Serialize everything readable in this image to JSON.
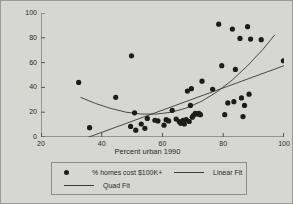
{
  "chart_data": {
    "type": "scatter",
    "title": "",
    "xlabel": "Percent urban 1990",
    "ylabel": "",
    "xlim": [
      20,
      100
    ],
    "ylim": [
      0,
      100
    ],
    "xticks": [
      20,
      40,
      60,
      80,
      100
    ],
    "yticks": [
      0,
      20,
      40,
      60,
      80,
      100
    ],
    "grid": false,
    "legend_position": "below",
    "series": [
      {
        "name": "% homes cost $100K+",
        "marker": "filled-circle",
        "color": "#1c1c1c",
        "points": [
          [
            32.4,
            44.0
          ],
          [
            36.0,
            7.5
          ],
          [
            44.6,
            32.0
          ],
          [
            49.8,
            65.5
          ],
          [
            49.5,
            8.5
          ],
          [
            50.8,
            19.5
          ],
          [
            51.2,
            5.5
          ],
          [
            53.0,
            10.5
          ],
          [
            54.2,
            7.0
          ],
          [
            55.0,
            15.0
          ],
          [
            57.5,
            13.5
          ],
          [
            58.5,
            13.0
          ],
          [
            60.5,
            9.5
          ],
          [
            61.2,
            14.0
          ],
          [
            62.0,
            13.0
          ],
          [
            63.2,
            21.5
          ],
          [
            64.5,
            14.5
          ],
          [
            65.5,
            12.5
          ],
          [
            66.0,
            11.0
          ],
          [
            66.8,
            13.5
          ],
          [
            67.2,
            10.5
          ],
          [
            67.8,
            14.0
          ],
          [
            68.2,
            37.0
          ],
          [
            68.8,
            12.5
          ],
          [
            69.2,
            25.5
          ],
          [
            69.5,
            39.0
          ],
          [
            69.8,
            16.0
          ],
          [
            70.2,
            17.5
          ],
          [
            70.8,
            19.0
          ],
          [
            71.5,
            18.5
          ],
          [
            72.0,
            19.0
          ],
          [
            72.5,
            18.0
          ],
          [
            73.0,
            45.0
          ],
          [
            76.5,
            38.5
          ],
          [
            78.5,
            91.0
          ],
          [
            79.5,
            57.5
          ],
          [
            80.5,
            18.0
          ],
          [
            81.5,
            27.5
          ],
          [
            83.0,
            87.0
          ],
          [
            83.5,
            28.5
          ],
          [
            84.0,
            54.5
          ],
          [
            85.5,
            79.5
          ],
          [
            86.0,
            31.5
          ],
          [
            86.5,
            16.5
          ],
          [
            87.0,
            25.5
          ],
          [
            88.0,
            89.0
          ],
          [
            88.5,
            34.5
          ],
          [
            89.0,
            79.0
          ],
          [
            92.5,
            78.5
          ],
          [
            99.8,
            61.5
          ]
        ]
      },
      {
        "name": "Linear Fit",
        "type": "line",
        "color": "#3a3a3a",
        "points": [
          [
            33.0,
            -2.5
          ],
          [
            100.0,
            57.5
          ]
        ]
      },
      {
        "name": "Quad Fit",
        "type": "line",
        "color": "#3a3a3a",
        "points": [
          [
            33.0,
            32.0
          ],
          [
            38.0,
            27.0
          ],
          [
            43.0,
            23.0
          ],
          [
            48.0,
            20.0
          ],
          [
            53.0,
            18.5
          ],
          [
            58.0,
            18.5
          ],
          [
            63.0,
            20.0
          ],
          [
            68.0,
            23.5
          ],
          [
            73.0,
            29.0
          ],
          [
            78.0,
            36.5
          ],
          [
            83.0,
            46.0
          ],
          [
            88.0,
            57.5
          ],
          [
            93.0,
            70.5
          ],
          [
            97.0,
            82.5
          ]
        ]
      }
    ]
  },
  "axes": {
    "y_tick_labels": [
      "100",
      "80",
      "60",
      "40",
      "20",
      "0"
    ],
    "x_tick_labels": [
      "20",
      "40",
      "60",
      "80",
      "100"
    ],
    "x_title": "Percent urban 1990"
  },
  "legend": {
    "entries": [
      {
        "label": "% homes cost $100K+",
        "marker": "dot"
      },
      {
        "label": "Linear Fit",
        "marker": "line"
      },
      {
        "label": "Quad Fit",
        "marker": "line"
      }
    ]
  }
}
